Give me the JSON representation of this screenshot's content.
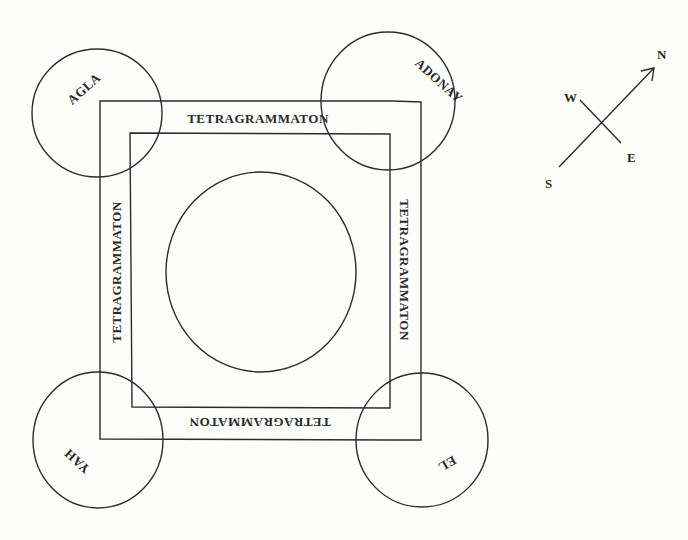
{
  "diagram": {
    "type": "magic-circle",
    "colors": {
      "ink": "#2c2c2c",
      "paper": "#fdfdfc"
    },
    "corner_circles": [
      {
        "id": "top-left",
        "label": "AGLA"
      },
      {
        "id": "top-right",
        "label": "ADONAY"
      },
      {
        "id": "bottom-left",
        "label": "YAH"
      },
      {
        "id": "bottom-right",
        "label": "EL"
      }
    ],
    "sides": {
      "top": "TETRAGRAMMATON",
      "right": "TETRAGRAMMATON",
      "bottom": "TETRAGRAMMATON",
      "left": "TETRAGRAMMATON"
    },
    "center": {
      "shape": "circle",
      "label": ""
    },
    "compass": {
      "north": "N",
      "south": "S",
      "east": "E",
      "west": "W"
    }
  }
}
